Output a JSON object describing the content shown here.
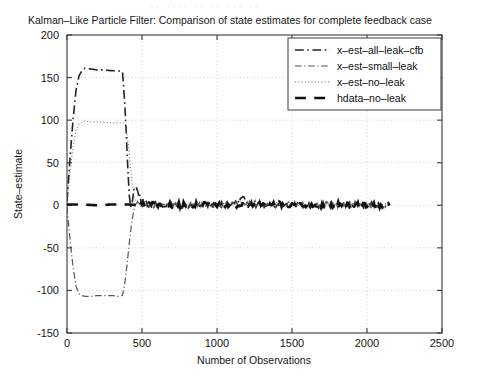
{
  "figure": {
    "scan_artifact_text": "·· ···· ·· ·· ··· ···",
    "title": "Kalman–Like Particle Filter: Comparison of state estimates for complete feedback case"
  },
  "axes": {
    "xlabel": "Number of Observations",
    "ylabel": "State–estimate",
    "xticks": [
      "0",
      "500",
      "1000",
      "1500",
      "2000",
      "2500"
    ],
    "yticks": [
      "-150",
      "-100",
      "-50",
      "0",
      "50",
      "100",
      "150",
      "200"
    ]
  },
  "legend": {
    "entries": [
      {
        "label": "x–est–all–leak–cfb",
        "style": "dashdot",
        "width": 1.6,
        "color": "#222222"
      },
      {
        "label": "x–est–small–leak",
        "style": "dashdot",
        "width": 1.2,
        "color": "#555555"
      },
      {
        "label": "x–est–no–leak",
        "style": "dotted",
        "width": 1.0,
        "color": "#666666"
      },
      {
        "label": "hdata–no–leak",
        "style": "dashed",
        "width": 2.6,
        "color": "#111111"
      }
    ]
  },
  "chart_data": {
    "type": "line",
    "title": "Kalman–Like Particle Filter: Comparison of state estimates for complete feedback case",
    "xlabel": "Number of Observations",
    "ylabel": "State–estimate",
    "xlim": [
      0,
      2500
    ],
    "ylim": [
      -150,
      200
    ],
    "xticks": [
      0,
      500,
      1000,
      1500,
      2000,
      2500
    ],
    "yticks": [
      -150,
      -100,
      -50,
      0,
      50,
      100,
      150,
      200
    ],
    "grid": true,
    "legend_position": "upper-right",
    "series": [
      {
        "name": "x–est–all–leak–cfb",
        "style": "dashdot",
        "comment": "rises from 0 to ~160 plateau by x=120, holds to x=370, falls through 0 near x=430, small overshoot, then noisy about 0 to x=2150",
        "x": [
          0,
          20,
          40,
          60,
          80,
          100,
          120,
          160,
          200,
          250,
          300,
          340,
          370,
          385,
          395,
          405,
          415,
          425,
          435,
          445,
          460,
          480,
          500,
          520,
          560,
          620,
          700,
          800,
          900,
          1000,
          1100,
          1180,
          1200,
          1260,
          1400,
          1550,
          1700,
          1850,
          2000,
          2100,
          2150
        ],
        "y": [
          5,
          55,
          100,
          135,
          152,
          158,
          161,
          160,
          159,
          159,
          158,
          158,
          157,
          120,
          85,
          45,
          12,
          -2,
          3,
          18,
          22,
          12,
          5,
          2,
          1,
          0,
          1,
          -1,
          1,
          0,
          1,
          9,
          4,
          1,
          0,
          1,
          0,
          1,
          0,
          1,
          0
        ]
      },
      {
        "name": "x–est–small–leak",
        "style": "dashdot",
        "comment": "rises from 0 to ~-105 plateau (negative branch) by x=120, holds to x=370, rises through 0 near x=440, then noisy about 0",
        "x": [
          0,
          20,
          40,
          60,
          80,
          100,
          120,
          160,
          200,
          250,
          300,
          340,
          370,
          385,
          400,
          415,
          430,
          445,
          460,
          480,
          500,
          540,
          600,
          700,
          800,
          900,
          1000,
          1100,
          1200,
          1350,
          1500,
          1700,
          1900,
          2050,
          2150
        ],
        "y": [
          -2,
          -40,
          -72,
          -95,
          -104,
          -106,
          -107,
          -107,
          -106,
          -106,
          -106,
          -107,
          -106,
          -92,
          -70,
          -45,
          -22,
          -6,
          2,
          4,
          2,
          1,
          0,
          1,
          0,
          1,
          0,
          1,
          2,
          0,
          1,
          0,
          1,
          0,
          0
        ]
      },
      {
        "name": "x–est–no–leak",
        "style": "dotted",
        "comment": "rises from 0 to ~98 plateau by x=110, holds to x=390, then decays through 0 near x=450 and stays near 0",
        "x": [
          0,
          20,
          40,
          60,
          80,
          100,
          110,
          150,
          200,
          260,
          320,
          370,
          390,
          405,
          420,
          435,
          450,
          470,
          500,
          560,
          640,
          760,
          900,
          1050,
          1200,
          1400,
          1600,
          1800,
          2000,
          2150
        ],
        "y": [
          3,
          38,
          68,
          88,
          96,
          98,
          99,
          98,
          98,
          97,
          97,
          97,
          96,
          78,
          52,
          26,
          8,
          2,
          1,
          0,
          1,
          0,
          1,
          0,
          1,
          0,
          1,
          0,
          0,
          0
        ]
      },
      {
        "name": "hdata–no–leak",
        "style": "dashed",
        "comment": "flat reference signal at 0 with very small noise across entire record",
        "x": [
          0,
          100,
          200,
          300,
          400,
          500,
          600,
          700,
          800,
          900,
          1000,
          1100,
          1200,
          1300,
          1400,
          1500,
          1600,
          1700,
          1800,
          1900,
          2000,
          2100,
          2150
        ],
        "y": [
          1,
          1,
          0,
          1,
          1,
          0,
          1,
          0,
          1,
          0,
          1,
          0,
          1,
          0,
          1,
          0,
          1,
          0,
          1,
          0,
          1,
          0,
          0
        ]
      }
    ],
    "annotations": [
      {
        "text": "all estimators converge to zero state-estimate after roughly 500 observations",
        "x": 500,
        "y": 0
      }
    ]
  }
}
